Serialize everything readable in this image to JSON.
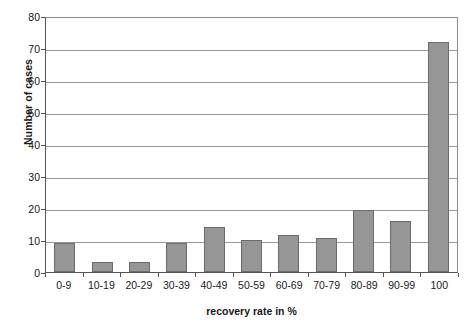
{
  "chart_data": {
    "type": "bar",
    "title": "",
    "subtitle": "",
    "xlabel": "recovery rate in %",
    "ylabel": "Number of cases",
    "categories": [
      "0-9",
      "10-19",
      "20-29",
      "30-39",
      "40-49",
      "50-59",
      "60-69",
      "70-79",
      "80-89",
      "90-99",
      "100"
    ],
    "values": [
      9,
      3,
      3,
      9,
      14,
      10,
      11.5,
      10.5,
      19.5,
      16,
      72
    ],
    "ylim": [
      0,
      80
    ],
    "ytick_labels": [
      "0",
      "10",
      "20",
      "30",
      "40",
      "50",
      "60",
      "70",
      "80"
    ],
    "ytick_values": [
      0,
      10,
      20,
      30,
      40,
      50,
      60,
      70,
      80
    ],
    "grid": "horizontal",
    "legend": "none",
    "bar_color": "#969696",
    "bar_border_color": "#6b6b6b",
    "gridline_color": "#9a9a9a",
    "axis_color": "#555555",
    "background_color": "#ffffff"
  }
}
